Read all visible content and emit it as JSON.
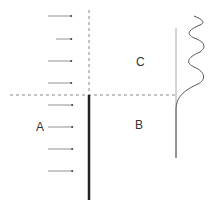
{
  "labels": {
    "A": "A",
    "B": "B",
    "C": "C"
  },
  "colors": {
    "line": "#222222",
    "dashed": "#888888",
    "arrow": "#666666",
    "curve": "#555555",
    "axis": "#aaaaaa"
  },
  "arrows": {
    "y_positions": [
      16,
      39,
      61,
      83,
      105,
      127,
      149,
      171
    ],
    "x_start": 48,
    "x_end": 73
  }
}
